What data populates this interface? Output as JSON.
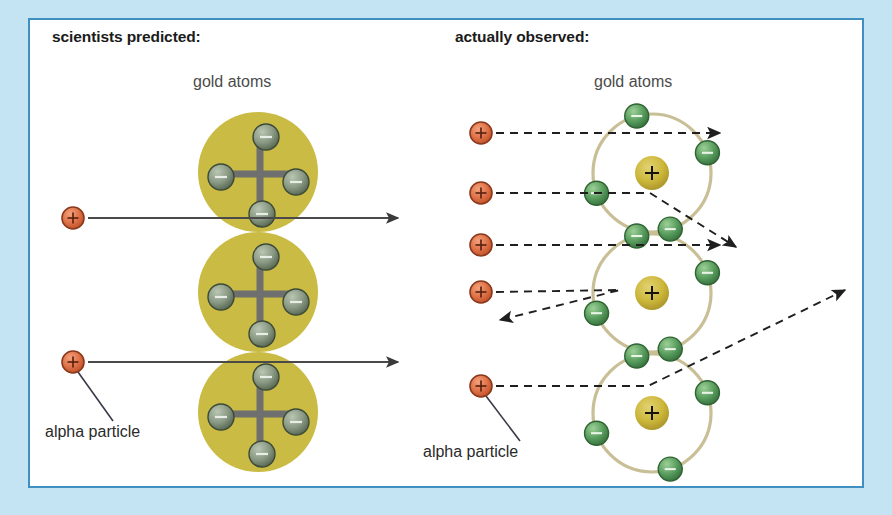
{
  "figure": {
    "domain": "diagram",
    "background_color": "#c4e4f4",
    "card_color": "#ffffff",
    "border_color": "#3f8fc0"
  },
  "panels": {
    "left": {
      "title": "scientists predicted:",
      "subtitle": "gold atoms",
      "alpha_label": "alpha particle",
      "model": "plum-pudding",
      "atom_fill": "#c9bb44",
      "cross_color": "#6f6f6f",
      "electron_fill": "#8a9a84",
      "atoms": [
        {
          "cx": 258,
          "cy": 172,
          "r": 60
        },
        {
          "cx": 258,
          "cy": 292,
          "r": 60
        },
        {
          "cx": 258,
          "cy": 412,
          "r": 60
        }
      ],
      "electron_offsets": [
        {
          "dx": 8,
          "dy": -35
        },
        {
          "dx": -37,
          "dy": 5
        },
        {
          "dx": 38,
          "dy": 10
        },
        {
          "dx": 4,
          "dy": 42
        }
      ],
      "alpha_particles": [
        {
          "cx": 73,
          "cy": 218
        },
        {
          "cx": 73,
          "cy": 362
        }
      ],
      "paths": [
        {
          "name": "straight-through-upper",
          "x1": 88,
          "y1": 218,
          "x2": 398,
          "y2": 218,
          "style": "solid"
        },
        {
          "name": "straight-through-lower",
          "x1": 88,
          "y1": 362,
          "x2": 398,
          "y2": 362,
          "style": "solid"
        }
      ],
      "leader": {
        "x1": 78,
        "y1": 372,
        "x2": 113,
        "y2": 421
      }
    },
    "right": {
      "title": "actually observed:",
      "subtitle": "gold atoms",
      "alpha_label": "alpha particle",
      "model": "nuclear",
      "orbit_color": "#c9bf96",
      "nucleus_fill": "#ccb73a",
      "nucleus_symbol": "+",
      "electron_fill": "#5a9e5f",
      "electron_symbol": "−",
      "atoms": [
        {
          "cx": 652,
          "cy": 173,
          "r": 59
        },
        {
          "cx": 652,
          "cy": 293,
          "r": 59
        },
        {
          "cx": 652,
          "cy": 413,
          "r": 59
        }
      ],
      "nucleus_radius": 17,
      "electron_radius": 12,
      "electron_angles": [
        -105,
        -20,
        160,
        72
      ],
      "alpha_particles": [
        {
          "cx": 481,
          "cy": 133
        },
        {
          "cx": 481,
          "cy": 193
        },
        {
          "cx": 481,
          "cy": 245
        },
        {
          "cx": 481,
          "cy": 292
        },
        {
          "cx": 481,
          "cy": 386
        }
      ],
      "paths": [
        {
          "name": "pass-through-top",
          "points": "496,133 720,133",
          "style": "dashed",
          "arrow": true
        },
        {
          "name": "deflected-small-angle",
          "points": "496,193 650,193 736,247",
          "style": "dashed",
          "arrow": true
        },
        {
          "name": "pass-through-middle",
          "points": "496,245 720,245",
          "style": "dashed",
          "arrow": true
        },
        {
          "name": "back-scattered",
          "points": "496,292 620,290 500,320",
          "style": "dashed",
          "arrow": true
        },
        {
          "name": "deflected-large-angle",
          "points": "496,386 648,386 845,290",
          "style": "dashed",
          "arrow": true
        }
      ],
      "leader": {
        "x1": 486,
        "y1": 396,
        "x2": 520,
        "y2": 441
      }
    }
  },
  "glyphs": {
    "alpha_particle": {
      "name": "alpha-particle-icon",
      "symbol": "+",
      "fill": "#e0734a",
      "stroke": "#8a3a1c"
    },
    "electron": {
      "name": "electron-icon",
      "symbol": "−"
    },
    "nucleus": {
      "name": "nucleus-icon",
      "symbol": "+"
    }
  }
}
